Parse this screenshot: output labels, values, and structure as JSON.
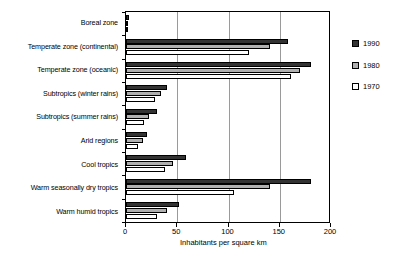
{
  "chart_data": {
    "type": "bar",
    "orientation": "horizontal",
    "title": "",
    "xlabel": "Inhabitants per square km",
    "ylabel": "",
    "xlim": [
      0,
      200
    ],
    "xticks": [
      0,
      50,
      100,
      150,
      200
    ],
    "grid": true,
    "legend_position": "right",
    "categories": [
      "Boreal zone",
      "Temperate zone (continental)",
      "Temperate zone (oceanic)",
      "Subtropics (winter rains)",
      "Subtropics (summer rains)",
      "Arid regions",
      "Cool tropics",
      "Warm seasonally dry tropics",
      "Warm humid tropics"
    ],
    "series": [
      {
        "name": "1990",
        "color": "#333333",
        "values": [
          3,
          158,
          180,
          40,
          30,
          20,
          59,
          180,
          52
        ]
      },
      {
        "name": "1980",
        "color": "#b0b0b0",
        "values": [
          2,
          140,
          170,
          34,
          22,
          17,
          46,
          140,
          40
        ]
      },
      {
        "name": "1970",
        "color": "#ffffff",
        "values": [
          2,
          120,
          161,
          28,
          18,
          12,
          38,
          105,
          30
        ]
      }
    ]
  },
  "legend": {
    "entries": [
      {
        "label": "1990"
      },
      {
        "label": "1980"
      },
      {
        "label": "1970"
      }
    ]
  },
  "axis": {
    "x_title": "Inhabitants per square km",
    "tick_labels": [
      "0",
      "50",
      "100",
      "150",
      "200"
    ]
  }
}
